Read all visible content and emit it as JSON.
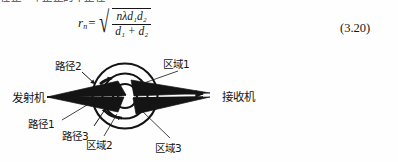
{
  "page": {
    "clipped_top_line": "在正一个正正的十正在",
    "background_color": "#fefefe",
    "ink_color": "#141414"
  },
  "equation": {
    "lhs_variable": "r",
    "lhs_subscript": "n",
    "equals": "=",
    "radical_glyph": "√",
    "numerator": "nλd₁d₂",
    "numerator_parts": [
      "n",
      "λ",
      "d",
      "1",
      "d",
      "2"
    ],
    "denominator": "d₁ + d₂",
    "denominator_parts": [
      "d",
      "1",
      "+",
      "d",
      "2"
    ],
    "number": "(3.20)",
    "plain_text": "r_n = sqrt( n λ d1 d2 / ( d1 + d2 ) )"
  },
  "figure": {
    "labels": {
      "transmitter": "发射机",
      "receiver": "接收机",
      "path1": "路径1",
      "path2": "路径2",
      "path3": "路径3",
      "zone1": "区域1",
      "zone2": "区域2",
      "zone3": "区域3"
    },
    "zones": [
      {
        "name": "区域1",
        "radius": 33,
        "index": 1
      },
      {
        "name": "区域2",
        "radius": 23,
        "index": 2
      },
      {
        "name": "区域3",
        "radius": 12,
        "index": 3
      }
    ],
    "paths": [
      {
        "name": "路径1",
        "index": 1
      },
      {
        "name": "路径2",
        "index": 2
      },
      {
        "name": "路径3",
        "index": 3
      }
    ],
    "center": {
      "x": 125,
      "y": 48
    },
    "transmitter_point": {
      "x": 47,
      "y": 49
    },
    "receiver_point": {
      "x": 213,
      "y": 48
    }
  }
}
